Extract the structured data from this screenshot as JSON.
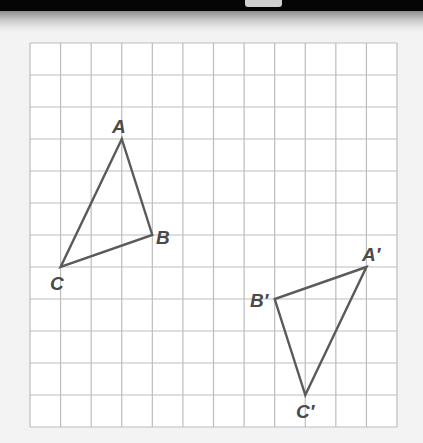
{
  "diagram": {
    "type": "coordinate-grid-rotation",
    "grid": {
      "columns": 12,
      "rows": 12,
      "line_color": "#bdbdbd",
      "background": "#ffffff"
    },
    "figures": [
      {
        "name": "triangle-ABC",
        "stroke": "#5a5a5a",
        "vertices": [
          {
            "label": "A",
            "grid": [
              3,
              3
            ]
          },
          {
            "label": "B",
            "grid": [
              4,
              6
            ]
          },
          {
            "label": "C",
            "grid": [
              1,
              7
            ]
          }
        ]
      },
      {
        "name": "triangle-A'B'C'",
        "stroke": "#5a5a5a",
        "vertices": [
          {
            "label": "A′",
            "grid": [
              11,
              7
            ]
          },
          {
            "label": "B′",
            "grid": [
              8,
              8
            ]
          },
          {
            "label": "C′",
            "grid": [
              9,
              11
            ]
          }
        ]
      }
    ],
    "labels": {
      "A": "A",
      "B": "B",
      "C": "C",
      "A_prime": "A′",
      "B_prime": "B′",
      "C_prime": "C′"
    }
  },
  "colors": {
    "top_bar": "#050505",
    "page_background": "#f3f3f3",
    "grid_line": "#bdbdbd",
    "triangle_stroke": "#5a5a5a",
    "label_text": "#4a4a4a"
  }
}
